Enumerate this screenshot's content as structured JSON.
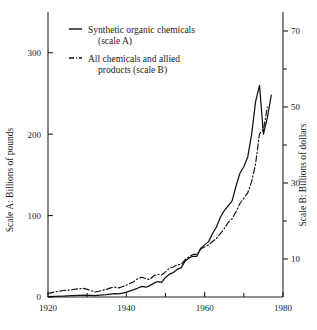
{
  "chart_data": {
    "type": "line",
    "title": "",
    "xlabel": "",
    "ylabel": "Scale A: Billions of pounds",
    "ylabel_right": "Scale B: Billions of dollars",
    "grid": false,
    "legend_position": "top-left",
    "xlim": [
      1920,
      1980
    ],
    "ylim": [
      0,
      350
    ],
    "ylim_right": [
      0,
      75
    ],
    "xticks": [
      1920,
      1940,
      1960,
      1980
    ],
    "xticks_minor": [
      1930,
      1950,
      1970
    ],
    "yticks_left": [
      0,
      100,
      200,
      300
    ],
    "yticks_right": [
      10,
      30,
      50,
      70
    ],
    "yticks_right_minor": [
      20,
      40,
      60
    ],
    "series": [
      {
        "name": "Synthetic organic chemicals (scale A)",
        "axis": "A",
        "style": "solid",
        "x": [
          1920,
          1922,
          1924,
          1926,
          1928,
          1930,
          1932,
          1934,
          1935,
          1936,
          1937,
          1938,
          1939,
          1940,
          1941,
          1942,
          1943,
          1944,
          1945,
          1946,
          1947,
          1948,
          1949,
          1950,
          1951,
          1952,
          1953,
          1954,
          1955,
          1956,
          1957,
          1958,
          1959,
          1960,
          1961,
          1962,
          1963,
          1964,
          1965,
          1966,
          1967,
          1968,
          1969,
          1970,
          1971,
          1972,
          1973,
          1974,
          1975,
          1976,
          1977
        ],
        "values": [
          0.5,
          0.8,
          1.2,
          1.6,
          2.0,
          2.2,
          1.8,
          2.6,
          3.0,
          3.6,
          4.2,
          3.8,
          4.8,
          6.0,
          7.6,
          9.0,
          11.0,
          13.0,
          12.0,
          14.0,
          17.0,
          19.0,
          18.0,
          24.0,
          28.0,
          30.0,
          34.0,
          36.0,
          44.0,
          48.0,
          50.0,
          50.0,
          60.0,
          64.0,
          68.0,
          78.0,
          86.0,
          98.0,
          106.0,
          112.0,
          118.0,
          136.0,
          152.0,
          160.0,
          172.0,
          200.0,
          240.0,
          260.0,
          200.0,
          220.0,
          248.0
        ]
      },
      {
        "name": "All chemicals and allied products (scale B)",
        "axis": "B",
        "style": "dash-dot",
        "x": [
          1920,
          1922,
          1924,
          1926,
          1928,
          1929,
          1930,
          1931,
          1932,
          1933,
          1934,
          1935,
          1936,
          1937,
          1938,
          1939,
          1940,
          1941,
          1942,
          1943,
          1944,
          1945,
          1946,
          1947,
          1948,
          1949,
          1950,
          1951,
          1952,
          1953,
          1954,
          1955,
          1956,
          1957,
          1958,
          1959,
          1960,
          1961,
          1962,
          1963,
          1964,
          1965,
          1966,
          1967,
          1968,
          1969,
          1970,
          1971,
          1972,
          1973,
          1974,
          1975,
          1976
        ],
        "values": [
          0.9,
          1.4,
          1.7,
          1.9,
          2.2,
          2.3,
          2.0,
          1.7,
          1.3,
          1.5,
          1.8,
          2.0,
          2.4,
          2.6,
          2.4,
          2.7,
          3.1,
          3.6,
          4.1,
          4.9,
          5.2,
          4.8,
          4.6,
          5.6,
          6.0,
          5.8,
          6.6,
          7.6,
          7.9,
          8.5,
          8.6,
          9.8,
          10.6,
          11.2,
          11.2,
          12.6,
          13.2,
          13.7,
          14.6,
          15.4,
          16.7,
          18.0,
          19.6,
          20.6,
          22.4,
          24.6,
          26.0,
          27.4,
          30.4,
          35.0,
          43.0,
          44.0,
          50.0
        ]
      }
    ]
  },
  "legend": {
    "items": [
      {
        "label_line1": "Synthetic organic chemicals",
        "label_line2": "(scale A)",
        "style": "solid"
      },
      {
        "label_line1": "All chemicals and allied",
        "label_line2": "products  (scale B)",
        "style": "dash-dot"
      }
    ]
  },
  "axes": {
    "left_title": "Scale A: Billions of pounds",
    "right_title": "Scale B: Billions of dollars",
    "x_tick_labels": [
      "1920",
      "1940",
      "1960",
      "1980"
    ],
    "y_left_tick_labels": [
      "0",
      "100",
      "200",
      "300"
    ],
    "y_right_tick_labels": [
      "10",
      "30",
      "50",
      "70"
    ]
  },
  "colors": {
    "ink": "#111111",
    "background": "#ffffff"
  }
}
